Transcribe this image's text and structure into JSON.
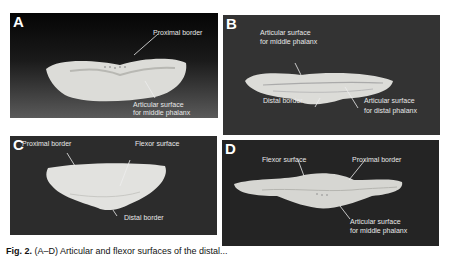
{
  "figure": {
    "panels": [
      {
        "letter": "A",
        "labels": [
          {
            "text": "Proximal border"
          },
          {
            "text": "Articular surface"
          },
          {
            "text": "for middle phalanx"
          }
        ]
      },
      {
        "letter": "B",
        "labels": [
          {
            "text": "Articular surface"
          },
          {
            "text": "for middle phalanx"
          },
          {
            "text": "Distal border"
          },
          {
            "text": "Articular surface"
          },
          {
            "text": "for distal phalanx"
          }
        ]
      },
      {
        "letter": "C",
        "labels": [
          {
            "text": "Proximal border"
          },
          {
            "text": "Flexor surface"
          },
          {
            "text": "Distal border"
          }
        ]
      },
      {
        "letter": "D",
        "labels": [
          {
            "text": "Flexor surface"
          },
          {
            "text": "Proximal border"
          },
          {
            "text": "Articular surface"
          },
          {
            "text": "for middle phalanx"
          }
        ]
      }
    ],
    "caption": {
      "label": "Fig. 2.",
      "text": "(A–D) Articular and flexor surfaces of the distal..."
    }
  }
}
